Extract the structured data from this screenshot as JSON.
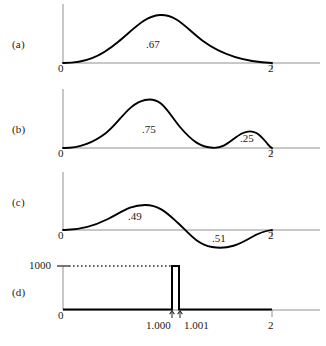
{
  "figure": {
    "colors": {
      "curve": "#000000",
      "axis": "#808080",
      "text": "#1a1a1a",
      "spike": "#000000"
    }
  },
  "panels": [
    {
      "tag": "(a)",
      "x_axis": {
        "left_label": "0",
        "right_label": "2",
        "domain": [
          0,
          2
        ]
      },
      "annotations": [
        {
          "label": ".67",
          "x": 0.95,
          "meaning": "area under single hump"
        }
      ],
      "curve": {
        "type": "single-hump",
        "peak_x": 0.92,
        "peak_height": 1.0,
        "zeros": [
          0,
          2
        ]
      }
    },
    {
      "tag": "(b)",
      "x_axis": {
        "left_label": "0",
        "right_label": "2",
        "domain": [
          0,
          2
        ]
      },
      "annotations": [
        {
          "label": ".75",
          "x": 0.85,
          "meaning": "area under large hump"
        },
        {
          "label": ".25",
          "x": 1.6,
          "meaning": "area under small hump"
        }
      ],
      "curve": {
        "type": "two-hump",
        "peaks": [
          {
            "x": 0.85,
            "height": 1.0
          },
          {
            "x": 1.62,
            "height": 0.42
          }
        ],
        "zeros": [
          0,
          1.25,
          2
        ]
      }
    },
    {
      "tag": "(c)",
      "x_axis": {
        "left_label": "0",
        "right_label": "2",
        "domain": [
          0,
          2
        ]
      },
      "annotations": [
        {
          "label": ".49",
          "x": 0.7,
          "meaning": "positive lobe area"
        },
        {
          "label": ".51",
          "x": 1.4,
          "meaning": "negative lobe area"
        }
      ],
      "curve": {
        "type": "sine-like",
        "peaks": [
          {
            "x": 0.72,
            "height": 0.52
          },
          {
            "x": 1.47,
            "height": -0.62
          }
        ],
        "zeros": [
          0,
          1.09,
          2
        ]
      }
    },
    {
      "tag": "(d)",
      "x_axis": {
        "left_label": "0",
        "right_label": "2",
        "domain": [
          0,
          2
        ],
        "inner_ticks": [
          {
            "label": "1.000",
            "x": 1.0
          },
          {
            "label": "1.001",
            "x": 1.001
          }
        ]
      },
      "y_axis": {
        "top_label": "1000",
        "value": 1000
      },
      "curve": {
        "type": "spike",
        "baseline": 0,
        "spike_height": 1000,
        "spike_from": 1.0,
        "spike_to": 1.001,
        "dotted_guide": true
      }
    }
  ]
}
